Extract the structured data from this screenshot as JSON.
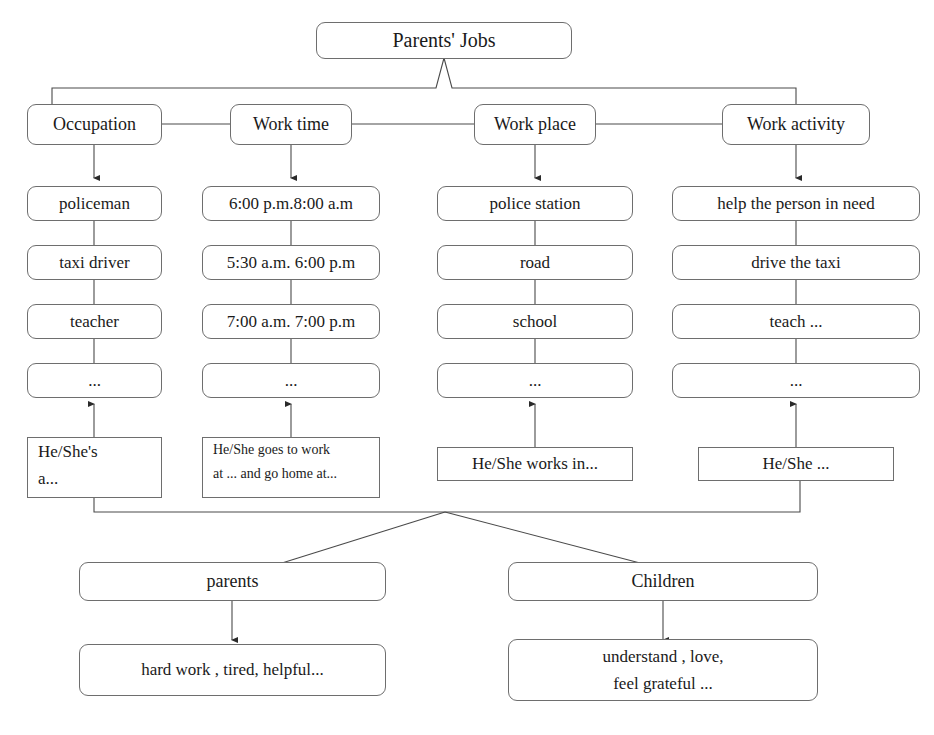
{
  "diagram": {
    "title": "Parents' Jobs",
    "categories": [
      {
        "label": "Occupation"
      },
      {
        "label": "Work time"
      },
      {
        "label": "Work place"
      },
      {
        "label": "Work activity"
      }
    ],
    "columns": [
      {
        "key": "occupation",
        "items": [
          "policeman",
          "taxi driver",
          "teacher",
          "..."
        ],
        "sentence_line1": "He/She's",
        "sentence_line2": "a..."
      },
      {
        "key": "work-time",
        "items": [
          "6:00 p.m.8:00 a.m",
          "5:30 a.m. 6:00 p.m",
          "7:00 a.m. 7:00 p.m",
          "..."
        ],
        "sentence_line1": "He/She goes to work",
        "sentence_line2": "at ... and go home at..."
      },
      {
        "key": "work-place",
        "items": [
          "police station",
          "road",
          "school",
          "..."
        ],
        "sentence_line1": "He/She works in...",
        "sentence_line2": ""
      },
      {
        "key": "work-activity",
        "items": [
          "help the person in need",
          "drive the taxi",
          "teach ...",
          "..."
        ],
        "sentence_line1": "He/She ...",
        "sentence_line2": ""
      }
    ],
    "outcomes": [
      {
        "key": "parents",
        "label": "parents",
        "result_line1": "hard work , tired, helpful...",
        "result_line2": ""
      },
      {
        "key": "children",
        "label": "Children",
        "result_line1": "understand , love,",
        "result_line2": "feel grateful ..."
      }
    ],
    "colors": {
      "stroke": "#6e6e6e",
      "line": "#4a4a4a",
      "text": "#1a1a1a",
      "background": "#ffffff"
    }
  }
}
